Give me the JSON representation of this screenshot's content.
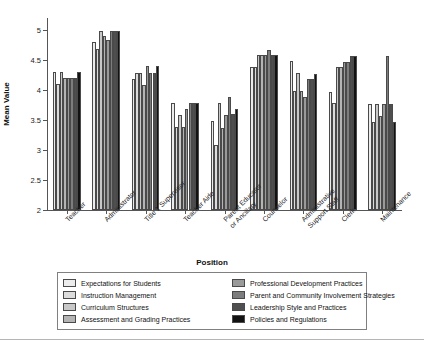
{
  "chart_data": {
    "type": "bar",
    "title": "",
    "xlabel": "Position",
    "ylabel": "Mean Value",
    "ylim": [
      2,
      5.2
    ],
    "yticks": [
      2,
      2.5,
      3,
      3.5,
      4,
      4.5,
      5
    ],
    "ytick_labels": [
      "2",
      "2.5",
      "3",
      "3.5",
      "4",
      "4.5",
      "5"
    ],
    "grid": false,
    "legend_position": "below-axes",
    "categories": [
      "Teacher",
      "Administrator",
      "Title 1 Supervisor",
      "Teacher Aide",
      "Parent Educator\nor Ancillary",
      "Counselor",
      "Administrative\nSupport Staff",
      "Clerk",
      "Maintenance"
    ],
    "category_lines": [
      [
        "Teacher"
      ],
      [
        "Administrator"
      ],
      [
        "Title 1 Supervisor"
      ],
      [
        "Teacher Aide"
      ],
      [
        "Parent Educator",
        "or Ancillary"
      ],
      [
        "Counselor"
      ],
      [
        "Administrative",
        "Support Staff"
      ],
      [
        "Clerk"
      ],
      [
        "Maintenance"
      ]
    ],
    "series": [
      {
        "name": "Expectations for Students",
        "color": "#ececec",
        "values": [
          4.3,
          4.8,
          4.19,
          3.78,
          3.48,
          4.38,
          4.48,
          3.97,
          3.76
        ]
      },
      {
        "name": "Instruction Management",
        "color": "#dcdcdc",
        "values": [
          4.1,
          4.69,
          4.29,
          3.39,
          3.08,
          4.38,
          3.98,
          3.78,
          3.47
        ]
      },
      {
        "name": "Curriculum Structures",
        "color": "#c8c8c8",
        "values": [
          4.3,
          4.99,
          4.29,
          3.58,
          3.78,
          4.58,
          4.28,
          4.38,
          3.76
        ]
      },
      {
        "name": "Assessment and Grading Practices",
        "color": "#b4b4b4",
        "values": [
          4.2,
          4.9,
          4.08,
          3.39,
          3.37,
          4.58,
          3.98,
          4.38,
          3.57
        ]
      },
      {
        "name": "Professional Development Practices",
        "color": "#9a9a9a",
        "values": [
          4.2,
          4.84,
          4.4,
          3.68,
          3.58,
          4.58,
          3.88,
          4.47,
          3.76
        ]
      },
      {
        "name": "Parent and Community Involvement Strategies",
        "color": "#7d7d7d",
        "values": [
          4.2,
          4.99,
          4.29,
          3.78,
          3.88,
          4.67,
          4.18,
          4.47,
          4.57
        ]
      },
      {
        "name": "Leadership Style and Practices",
        "color": "#4f4f4f",
        "values": [
          4.2,
          4.99,
          4.29,
          3.78,
          3.6,
          4.58,
          4.18,
          4.57,
          3.76
        ]
      },
      {
        "name": "Policies and Regulations",
        "color": "#121212",
        "values": [
          4.3,
          4.99,
          4.4,
          3.78,
          3.68,
          4.58,
          4.27,
          4.57,
          3.46
        ]
      }
    ]
  }
}
